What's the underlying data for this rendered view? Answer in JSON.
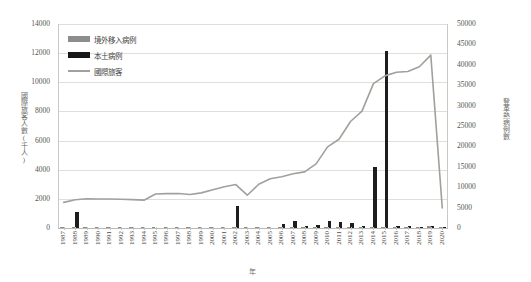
{
  "chart_data": {
    "type": "bar",
    "title": "",
    "subtitle": "",
    "xlabel": "年",
    "ylabel": "國際旅客人數(千人)",
    "y2label": "登革熱病例數",
    "ylim": [
      0,
      14000
    ],
    "y2lim": [
      0,
      50000
    ],
    "ytick_labels": [
      "14000",
      "12000",
      "10000",
      "8000",
      "6000",
      "4000",
      "2000",
      "0"
    ],
    "ytick_values": [
      14000,
      12000,
      10000,
      8000,
      6000,
      4000,
      2000,
      0
    ],
    "y2tick_labels": [
      "50000",
      "45000",
      "40000",
      "35000",
      "30000",
      "25000",
      "20000",
      "15000",
      "10000",
      "5000",
      "0"
    ],
    "y2tick_values": [
      50000,
      45000,
      40000,
      35000,
      30000,
      25000,
      20000,
      15000,
      10000,
      5000,
      0
    ],
    "grid": true,
    "legend_position": "upper-left",
    "categories": [
      "1987",
      "1988",
      "1989",
      "1990",
      "1991",
      "1992",
      "1993",
      "1994",
      "1995",
      "1996",
      "1997",
      "1998",
      "1999",
      "2000",
      "2001",
      "2002",
      "2003",
      "2004",
      "2005",
      "2006",
      "2007",
      "2008",
      "2009",
      "2010",
      "2011",
      "2012",
      "2013",
      "2014",
      "2015",
      "2016",
      "2017",
      "2018",
      "2019",
      "2020"
    ],
    "series": [
      {
        "name": "境外移入病例",
        "axis": "right",
        "kind": "bar",
        "color": "#8d8d8d",
        "values": [
          60,
          120,
          40,
          30,
          30,
          30,
          30,
          30,
          30,
          30,
          30,
          30,
          30,
          30,
          50,
          200,
          60,
          70,
          80,
          100,
          150,
          200,
          180,
          250,
          200,
          190,
          210,
          240,
          360,
          350,
          330,
          290,
          430,
          250
        ]
      },
      {
        "name": "本土病例",
        "axis": "right",
        "kind": "bar",
        "color": "#1d1d1d",
        "values": [
          0,
          4000,
          0,
          0,
          0,
          0,
          0,
          0,
          0,
          0,
          0,
          0,
          0,
          0,
          0,
          5300,
          0,
          0,
          0,
          900,
          1800,
          600,
          700,
          1800,
          1500,
          1300,
          600,
          15000,
          43400,
          400,
          500,
          200,
          400,
          50
        ]
      },
      {
        "name": "國際旅客",
        "axis": "left",
        "kind": "line",
        "color": "#a0a09c",
        "values": [
          1760,
          1940,
          2010,
          1990,
          1990,
          1970,
          1950,
          1910,
          2330,
          2360,
          2370,
          2300,
          2410,
          2620,
          2830,
          2980,
          2250,
          3000,
          3380,
          3520,
          3720,
          3850,
          4400,
          5570,
          6090,
          7310,
          8020,
          9910,
          10440,
          10690,
          10740,
          11070,
          11860,
          1380
        ]
      }
    ],
    "annotations": []
  },
  "legend": {
    "items": [
      {
        "label": "境外移入病例",
        "marker": "bar-swatch-gray"
      },
      {
        "label": "本土病例",
        "marker": "bar-swatch-black"
      },
      {
        "label": "國際旅客",
        "marker": "line-swatch-gray"
      }
    ]
  },
  "colors": {
    "imported_bar": "#8d8d8d",
    "local_bar": "#1d1d1d",
    "tourist_line": "#a0a09c",
    "grid": "#dededa",
    "text": "#4a4a46",
    "background": "#ffffff"
  }
}
